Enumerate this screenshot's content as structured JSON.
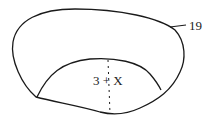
{
  "diagram": {
    "labels": {
      "inner_region": "3 + X",
      "outer_callout": "19"
    },
    "colors": {
      "stroke": "#1a1a1a",
      "background": "#ffffff"
    }
  }
}
